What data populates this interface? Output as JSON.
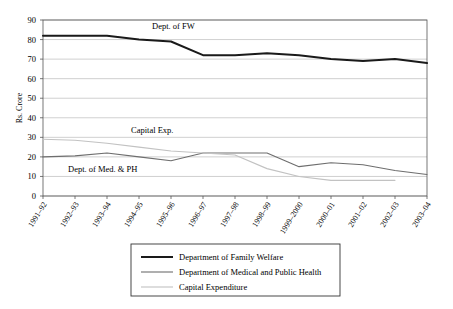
{
  "chart_data": {
    "type": "line",
    "title": "",
    "xlabel": "",
    "ylabel": "Rs. Crore",
    "ylim": [
      0,
      90
    ],
    "ytick_step": 10,
    "grid": true,
    "legend_position": "bottom",
    "categories": [
      "1991–92",
      "1992–93",
      "1993–94",
      "1994–95",
      "1995–96",
      "1996–97",
      "1997–98",
      "1998–99",
      "1999–2000",
      "2000–01",
      "2001–02",
      "2002–03",
      "2003–04"
    ],
    "yticks": [
      "0",
      "10",
      "20",
      "30",
      "40",
      "50",
      "60",
      "70",
      "80",
      "90"
    ],
    "series": [
      {
        "name": "Department of Family Welfare",
        "color": "#1a1a1a",
        "width": 2.0,
        "values": [
          82,
          82,
          82,
          80,
          79,
          72,
          72,
          73,
          72,
          70,
          69,
          70,
          68
        ]
      },
      {
        "name": "Department of Medical and Public Health",
        "color": "#6e6e6e",
        "width": 1.1,
        "values": [
          20,
          20.5,
          22,
          20,
          18,
          22,
          22,
          22,
          15,
          17,
          16,
          13,
          11
        ]
      },
      {
        "name": "Capital Expenditure",
        "color": "#c2c2c2",
        "width": 1.1,
        "values": [
          29,
          28.5,
          27,
          25,
          23,
          22,
          21,
          14,
          10,
          8,
          8,
          8,
          null
        ]
      }
    ],
    "annotations": [
      {
        "text": "Dept. of FW",
        "x": 1991,
        "y": 85
      },
      {
        "text": "Capital Exp.",
        "x": 1995,
        "y": 32
      },
      {
        "text": "Dept. of Med. & PH",
        "x": 1993,
        "y": 13
      }
    ]
  },
  "axis": {
    "y_title": "Rs. Crore"
  },
  "annotations": {
    "fw": "Dept. of FW",
    "capital": "Capital Exp.",
    "medph": "Dept. of Med. & PH"
  },
  "legend": {
    "items": [
      {
        "label": "Department of Family Welfare"
      },
      {
        "label": "Department of Medical and Public Health"
      },
      {
        "label": "Capital Expenditure"
      }
    ]
  }
}
